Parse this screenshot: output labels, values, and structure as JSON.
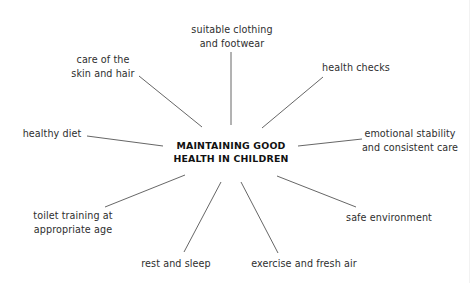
{
  "diagram": {
    "center": {
      "line1": "MAINTAINING GOOD",
      "line2": "HEALTH IN CHILDREN"
    },
    "branches": [
      {
        "id": "clothing",
        "lines": [
          "suitable clothing",
          "and footwear"
        ]
      },
      {
        "id": "health-checks",
        "lines": [
          "health checks"
        ]
      },
      {
        "id": "emotional",
        "lines": [
          "emotional stability",
          "and consistent care"
        ]
      },
      {
        "id": "safe-environment",
        "lines": [
          "safe environment"
        ]
      },
      {
        "id": "exercise",
        "lines": [
          "exercise and fresh air"
        ]
      },
      {
        "id": "rest",
        "lines": [
          "rest and sleep"
        ]
      },
      {
        "id": "toilet-training",
        "lines": [
          "toilet training at",
          "appropriate age"
        ]
      },
      {
        "id": "healthy-diet",
        "lines": [
          "healthy diet"
        ]
      },
      {
        "id": "skin-hair",
        "lines": [
          "care of the",
          "skin and hair"
        ]
      }
    ],
    "line_color": "#555555",
    "text_color": "#2e2e2e"
  }
}
